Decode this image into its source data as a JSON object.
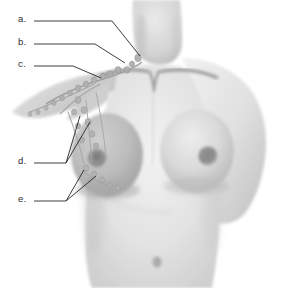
{
  "figure": {
    "style": "grayscale medical illustration",
    "background_color": "#ffffff",
    "skin_color": "#d8d8d8",
    "shadow_color": "#a8a8a8",
    "node_color": "#9a9a9a",
    "line_color": "#1c1c1c",
    "text_color": "#2b2b2b"
  },
  "labels": [
    {
      "id": "a",
      "text": "a.",
      "x": 18,
      "y": 18,
      "target": "supraclavicular lymph nodes",
      "leader": [
        [
          34,
          21
        ],
        [
          112,
          21
        ],
        [
          140,
          56
        ]
      ]
    },
    {
      "id": "b",
      "text": "b.",
      "x": 18,
      "y": 41,
      "target": "infraclavicular lymph nodes",
      "leader": [
        [
          34,
          44
        ],
        [
          95,
          44
        ],
        [
          125,
          63
        ]
      ]
    },
    {
      "id": "c",
      "text": "c.",
      "x": 18,
      "y": 63,
      "target": "clavicle and subclavian lymphatic trunk",
      "leader": [
        [
          34,
          66
        ],
        [
          73,
          66
        ],
        [
          101,
          78
        ]
      ]
    },
    {
      "id": "d",
      "text": "d.",
      "x": 18,
      "y": 160,
      "target": "axillary lymph nodes",
      "leader": [
        [
          34,
          163
        ],
        [
          66,
          163
        ],
        [
          80,
          116
        ]
      ],
      "leader2": [
        [
          66,
          163
        ],
        [
          90,
          122
        ]
      ]
    },
    {
      "id": "e",
      "text": "e.",
      "x": 18,
      "y": 198,
      "target": "mammary and pectoral lymph nodes",
      "leader": [
        [
          34,
          201
        ],
        [
          66,
          201
        ],
        [
          84,
          170
        ]
      ],
      "leader2": [
        [
          66,
          201
        ],
        [
          96,
          176
        ]
      ]
    }
  ],
  "anatomy": {
    "structures": [
      "neck",
      "clavicle",
      "sternal notch",
      "raised right arm",
      "left shoulder",
      "right breast",
      "left breast",
      "nipple and areola",
      "abdomen",
      "navel",
      "axillary lymph node chain",
      "breast lymphatic vessels"
    ]
  }
}
